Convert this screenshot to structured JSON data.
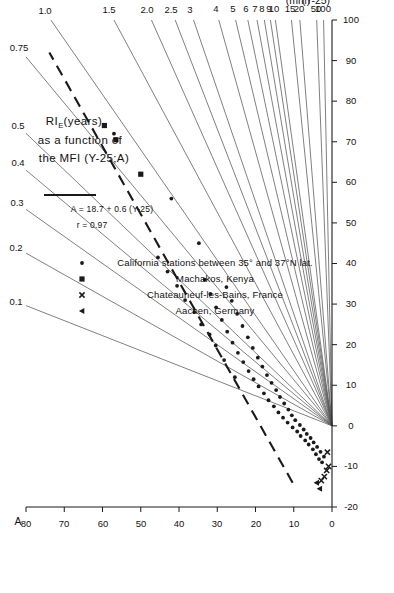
{
  "chart_data": {
    "type": "scatter",
    "title_lines": [
      "RI",
      "E",
      "(years)",
      "as a function of",
      "the MFI (Y-25;A)"
    ],
    "xlabel": "(Y-25)",
    "xunit": "(mm)",
    "ylabel": "A",
    "xlim": [
      -20,
      100
    ],
    "ylim": [
      0,
      80
    ],
    "xticks": [
      -20,
      -10,
      0,
      10,
      20,
      30,
      40,
      50,
      60,
      70,
      80,
      90,
      100
    ],
    "yticks": [
      0,
      10,
      20,
      30,
      40,
      50,
      60,
      70,
      80
    ],
    "grid": false,
    "legend_position": "upper-right",
    "fit": {
      "equation": "A = 18.7 + 0.6 (Y-25)",
      "correlation": "r = 0.97",
      "style": "dashed",
      "slope": 0.6,
      "intercept": 18.7,
      "x_from": -14,
      "x_to": 92
    },
    "rays": [
      {
        "label": "0.1",
        "slope": 2.7
      },
      {
        "label": "0.2",
        "slope": 1.88
      },
      {
        "label": "0.3",
        "slope": 1.5
      },
      {
        "label": "0.4",
        "slope": 1.27
      },
      {
        "label": "0.5",
        "slope": 1.11
      },
      {
        "label": "0.75",
        "slope": 0.88
      },
      {
        "label": "1.0",
        "slope": 0.735
      },
      {
        "label": "1.5",
        "slope": 0.57
      },
      {
        "label": "2.0",
        "slope": 0.472
      },
      {
        "label": "2.5",
        "slope": 0.41
      },
      {
        "label": "3",
        "slope": 0.362
      },
      {
        "label": "4",
        "slope": 0.296
      },
      {
        "label": "5",
        "slope": 0.252
      },
      {
        "label": "6",
        "slope": 0.22
      },
      {
        "label": "7",
        "slope": 0.196
      },
      {
        "label": "8",
        "slope": 0.177
      },
      {
        "label": "9",
        "slope": 0.161
      },
      {
        "label": "10",
        "slope": 0.148
      },
      {
        "label": "15",
        "slope": 0.106
      },
      {
        "label": "20",
        "slope": 0.084
      },
      {
        "label": "50",
        "slope": 0.04
      },
      {
        "label": "100",
        "slope": 0.022
      }
    ],
    "series": [
      {
        "name": "California stations between 35° and 37°N lat.",
        "marker": "dot",
        "points": [
          [
            -9.0,
            2.6
          ],
          [
            -8.2,
            3.4
          ],
          [
            -7.6,
            2.1
          ],
          [
            -7.0,
            4.2
          ],
          [
            -6.4,
            3.0
          ],
          [
            -5.8,
            5.0
          ],
          [
            -5.2,
            3.9
          ],
          [
            -4.6,
            6.1
          ],
          [
            -4.1,
            4.8
          ],
          [
            -3.6,
            7.0
          ],
          [
            -3.0,
            5.6
          ],
          [
            -2.5,
            8.2
          ],
          [
            -2.0,
            6.6
          ],
          [
            -1.4,
            9.1
          ],
          [
            -0.9,
            7.4
          ],
          [
            -0.4,
            10.3
          ],
          [
            0.2,
            8.4
          ],
          [
            0.8,
            11.6
          ],
          [
            1.4,
            9.6
          ],
          [
            2.0,
            12.8
          ],
          [
            2.6,
            10.5
          ],
          [
            3.3,
            14.0
          ],
          [
            4.0,
            11.4
          ],
          [
            4.8,
            15.2
          ],
          [
            5.5,
            12.5
          ],
          [
            6.3,
            16.6
          ],
          [
            7.1,
            13.6
          ],
          [
            8.0,
            17.8
          ],
          [
            8.8,
            14.6
          ],
          [
            9.7,
            19.2
          ],
          [
            10.6,
            15.8
          ],
          [
            11.5,
            20.5
          ],
          [
            12.5,
            17.0
          ],
          [
            13.5,
            21.8
          ],
          [
            14.6,
            18.2
          ],
          [
            15.7,
            23.2
          ],
          [
            16.8,
            19.4
          ],
          [
            18.0,
            24.6
          ],
          [
            19.2,
            20.7
          ],
          [
            20.5,
            26.0
          ],
          [
            21.8,
            22.0
          ],
          [
            23.2,
            27.4
          ],
          [
            24.6,
            23.4
          ],
          [
            26.1,
            28.8
          ],
          [
            27.6,
            24.8
          ],
          [
            29.2,
            30.3
          ],
          [
            30.8,
            26.2
          ],
          [
            32.5,
            31.8
          ],
          [
            34.2,
            27.6
          ],
          [
            36.0,
            33.3
          ],
          [
            12.0,
            25.4
          ],
          [
            16.2,
            28.2
          ],
          [
            19.8,
            30.4
          ],
          [
            22.5,
            32.0
          ],
          [
            25.0,
            34.2
          ],
          [
            28.0,
            36.0
          ],
          [
            31.0,
            38.4
          ],
          [
            34.5,
            40.5
          ],
          [
            38.0,
            43.0
          ],
          [
            41.5,
            45.5
          ],
          [
            45.0,
            34.8
          ],
          [
            56.0,
            42.0
          ],
          [
            72.0,
            57.0
          ]
        ]
      },
      {
        "name": "Machakos, Kenya",
        "marker": "square",
        "points": [
          [
            62.0,
            50.0
          ],
          [
            70.5,
            56.5
          ],
          [
            74.0,
            59.5
          ]
        ]
      },
      {
        "name": "Chateauneuf-les-Bains, France",
        "marker": "cross",
        "points": [
          [
            -12.5,
            2.0
          ],
          [
            -11.0,
            1.4
          ],
          [
            -10.0,
            0.9
          ],
          [
            -13.5,
            2.8
          ],
          [
            -6.5,
            1.2
          ]
        ]
      },
      {
        "name": "Aachen, Germany",
        "marker": "triangle",
        "points": [
          [
            -15.5,
            3.2
          ],
          [
            -14.0,
            4.0
          ]
        ]
      }
    ]
  },
  "legend": {
    "fit_entries": [
      {
        "text": "A = 18.7 + 0.6 (Y-25)"
      },
      {
        "text": "r = 0.97"
      }
    ],
    "entries": [
      {
        "marker": "dot",
        "label": "California stations between 35° and 37°N lat."
      },
      {
        "marker": "square",
        "label": "Machakos, Kenya"
      },
      {
        "marker": "cross",
        "label": "Chateauneuf-les-Bains, France"
      },
      {
        "marker": "triangle",
        "label": "Aachen, Germany"
      }
    ]
  },
  "colors": {
    "ink": "#1a1a1a",
    "ray": "#555555",
    "background": "#ffffff"
  }
}
